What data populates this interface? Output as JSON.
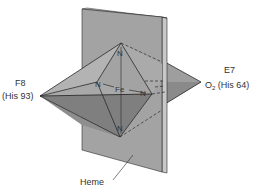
{
  "figure": {
    "labels": {
      "f8_line1": "F8",
      "f8_line2": "(His 93)",
      "e7_line1": "E7",
      "o2_main": "O",
      "o2_sub": "2",
      "o2_rest": " (His 64)",
      "heme": "Heme",
      "fe": "Fe",
      "n_top": "N",
      "n_bottom": "N",
      "n_left": "N",
      "n_right": "N"
    },
    "colors": {
      "plane_face": "#a3a3a3",
      "plane_edge": "#c4c4c4",
      "pyramid_light": "#b0b0b0",
      "pyramid_mid": "#9a9a9a",
      "pyramid_dark": "#7d7d7d",
      "line": "#2a2a2a",
      "text": "#333333"
    }
  }
}
